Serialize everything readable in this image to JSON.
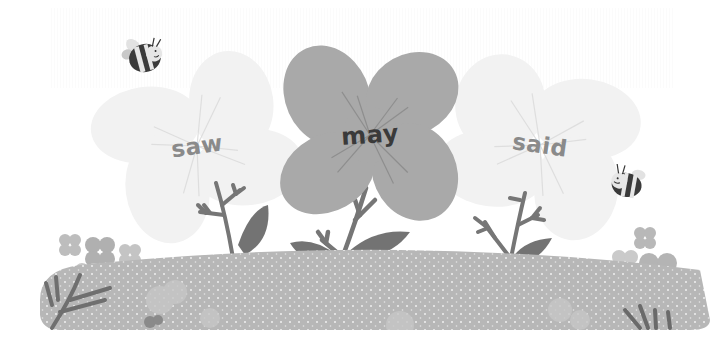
{
  "game": {
    "type": "sight-word flower choice",
    "flowers": [
      {
        "word": "saw",
        "state": "faded",
        "petal_color": "#f2f2f2",
        "vein_color": "#dcdcdc",
        "text_color": "#8a8a8a",
        "center": [
          197,
          146
        ],
        "rotation": -8
      },
      {
        "word": "may",
        "state": "selected",
        "petal_color": "#a9a9a9",
        "vein_color": "#8e8e8e",
        "text_color": "#3a3a3a",
        "center": [
          370,
          135
        ],
        "rotation": -4
      },
      {
        "word": "said",
        "state": "faded",
        "petal_color": "#f2f2f2",
        "vein_color": "#dcdcdc",
        "text_color": "#8a8a8a",
        "center": [
          540,
          145
        ],
        "rotation": 8
      }
    ],
    "decorations": {
      "bees": [
        {
          "name": "bee-top-left",
          "position": [
            145,
            58
          ]
        },
        {
          "name": "bee-right",
          "position": [
            626,
            182
          ]
        }
      ],
      "meadow_color": "#b4b4b4",
      "stem_color": "#6e6e6e",
      "leaf_color": "#707070",
      "background_color": "#ffffff"
    }
  }
}
